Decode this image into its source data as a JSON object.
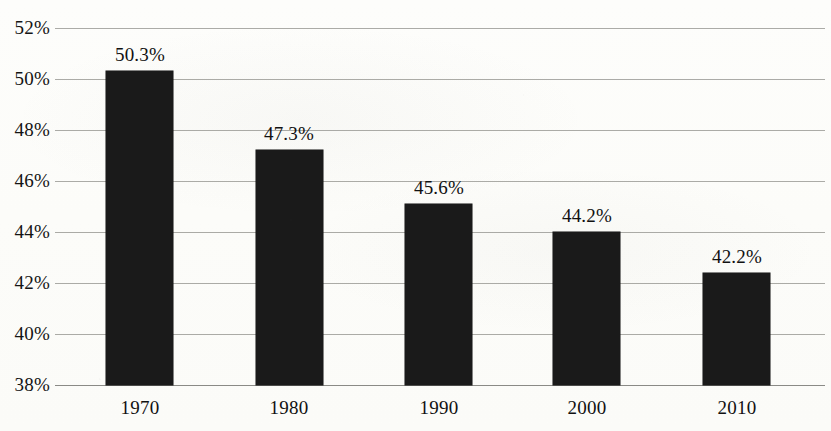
{
  "chart_data": {
    "type": "bar",
    "title": "",
    "subtitle": "",
    "xlabel": "",
    "ylabel": "",
    "categories": [
      "1970",
      "1980",
      "1990",
      "2000",
      "2010"
    ],
    "values": [
      50.3,
      47.2,
      45.1,
      44.0,
      42.4
    ],
    "data_labels": [
      "50.3%",
      "47.3%",
      "45.6%",
      "44.2%",
      "42.2%"
    ],
    "ylim": [
      38,
      52
    ],
    "ytick_step": 2,
    "ytick_labels": [
      "52%",
      "50%",
      "48%",
      "46%",
      "44%",
      "42%",
      "40%",
      "38%"
    ],
    "ytick_values": [
      52,
      50,
      48,
      46,
      44,
      42,
      40,
      38
    ],
    "grid": true,
    "grid_axis": "y",
    "legend": false,
    "legend_position": "none",
    "bar_color": "#1a1a1a",
    "grid_color": "#9c9c98",
    "background_color": "#fdfdfa",
    "text_color": "#111111",
    "annotations": []
  },
  "axis": {
    "baseline_label": "38%"
  }
}
